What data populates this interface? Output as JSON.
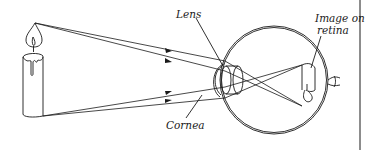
{
  "figure": {
    "labels": {
      "lens": "Lens",
      "cornea": "Cornea",
      "image_line1": "Image on",
      "image_line2": "retina"
    },
    "elements": [
      "candle",
      "light-rays",
      "cornea",
      "lens",
      "eyeball",
      "retina-image",
      "optic-nerve"
    ],
    "colors": {
      "ink": "#1a1a1a",
      "background": "#ffffff"
    }
  }
}
